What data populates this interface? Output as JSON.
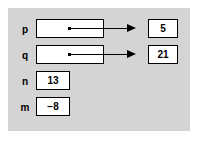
{
  "diagram": {
    "panel_color": "#d4d4d4",
    "page_color": "#ffffff",
    "ink_color": "#000000",
    "variables": [
      {
        "label": "p",
        "kind": "pointer",
        "value": "",
        "points_to": "5"
      },
      {
        "label": "q",
        "kind": "pointer",
        "value": "",
        "points_to": "21"
      },
      {
        "label": "n",
        "kind": "integer",
        "value": "13",
        "points_to": ""
      },
      {
        "label": "m",
        "kind": "integer",
        "value": "−8",
        "points_to": ""
      }
    ],
    "targets": [
      {
        "name": "target-p",
        "value": "5"
      },
      {
        "name": "target-q",
        "value": "21"
      }
    ]
  }
}
